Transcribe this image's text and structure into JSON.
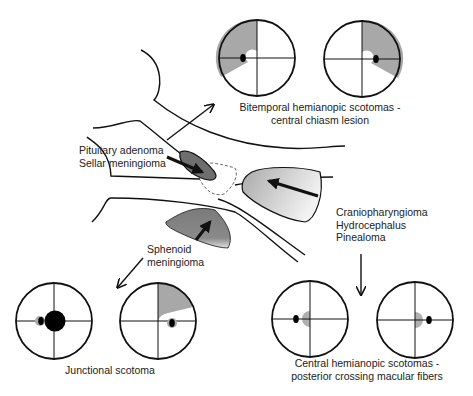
{
  "labels": {
    "bitemporal_line1": "Bitemporal hemianopic scotomas -",
    "bitemporal_line2": "central chiasm lesion",
    "pituitary_line1": "Pituitary adenoma",
    "pituitary_line2": "Sellar meningioma",
    "cranio_line1": "Craniopharyngioma",
    "cranio_line2": "Hydrocephalus",
    "cranio_line3": "Pinealoma",
    "sphenoid_line1": "Sphenoid",
    "sphenoid_line2": "meningioma",
    "junctional": "Junctional scotoma",
    "central_line1": "Central hemianopic scotomas -",
    "central_line2": "posterior crossing macular fibers"
  },
  "colors": {
    "stroke": "#111111",
    "field_defect_gray": "#a8a8a8",
    "tumor_dark": "#6e6e6e",
    "tumor_light": "#c8c8c8"
  }
}
